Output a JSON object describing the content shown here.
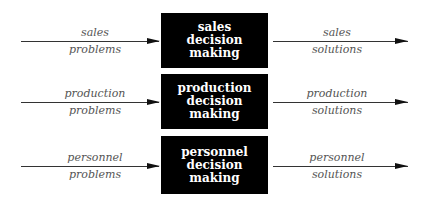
{
  "rows": [
    {
      "box": [
        "sales",
        "decision",
        "making"
      ],
      "input": {
        "top": "sales",
        "bottom": "problems"
      },
      "output": {
        "top": "sales",
        "bottom": "solutions"
      }
    },
    {
      "box": [
        "production",
        "decision",
        "making"
      ],
      "input": {
        "top": "production",
        "bottom": "problems"
      },
      "output": {
        "top": "production",
        "bottom": "solutions"
      }
    },
    {
      "box": [
        "personnel",
        "decision",
        "making"
      ],
      "input": {
        "top": "personnel",
        "bottom": "problems"
      },
      "output": {
        "top": "personnel",
        "bottom": "solutions"
      }
    }
  ]
}
